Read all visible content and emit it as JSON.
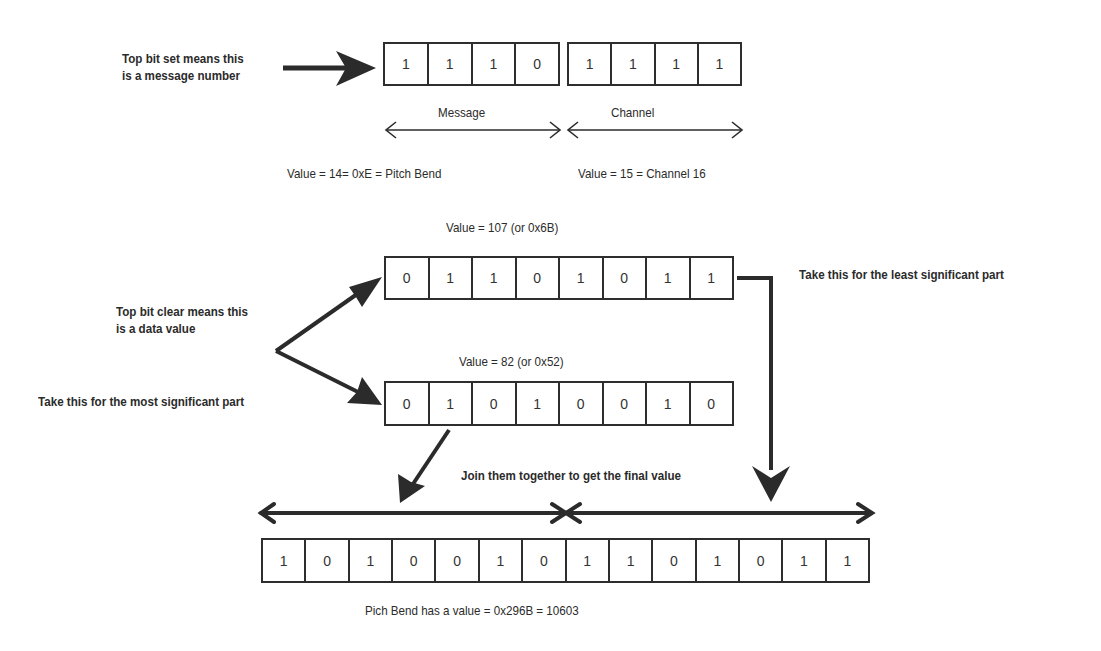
{
  "status_byte": {
    "note": "Top bit set means this\nis a message number",
    "note_line1": "Top bit set means this",
    "note_line2": "is a message number",
    "message_bits": [
      "1",
      "1",
      "1",
      "0"
    ],
    "channel_bits": [
      "1",
      "1",
      "1",
      "1"
    ],
    "message_label": "Message",
    "channel_label": "Channel",
    "message_value": "Value = 14= 0xE = Pitch Bend",
    "channel_value": "Value = 15 = Channel 16"
  },
  "data_bytes": {
    "note_line1": "Top bit clear means this",
    "note_line2": "is a data value",
    "lsb": {
      "value_label": "Value = 107 (or 0x6B)",
      "bits": [
        "0",
        "1",
        "1",
        "0",
        "1",
        "0",
        "1",
        "1"
      ],
      "caption": "Take this for the least significant part"
    },
    "msb": {
      "value_label": "Value = 82 (or 0x52)",
      "bits": [
        "0",
        "1",
        "0",
        "1",
        "0",
        "0",
        "1",
        "0"
      ],
      "caption": "Take this for the most significant part"
    }
  },
  "result": {
    "join_label": "Join them together to get the final value",
    "bits": [
      "1",
      "0",
      "1",
      "0",
      "0",
      "1",
      "0",
      "1",
      "1",
      "0",
      "1",
      "0",
      "1",
      "1"
    ],
    "caption": "Pich Bend has a value = 0x296B = 10603"
  },
  "colors": {
    "ink": "#2b2b2b",
    "background": "#ffffff"
  }
}
